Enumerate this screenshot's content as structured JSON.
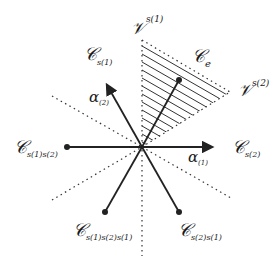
{
  "diagram": {
    "title": "",
    "center": {
      "x": 142,
      "y": 147
    },
    "colors": {
      "stroke": "#222222",
      "hatch": "#333333",
      "background": "#ffffff"
    },
    "labels": {
      "v_s1": {
        "main": "𝒱",
        "sup": "s(1)"
      },
      "v_s2": {
        "main": "𝒱",
        "sup": "s(2)"
      },
      "c_e": {
        "main": "𝒞",
        "sub": "e"
      },
      "c_s1": {
        "main": "𝒞",
        "sub": "s(1)"
      },
      "c_s1s2": {
        "main": "𝒞",
        "sub": "s(1)s(2)"
      },
      "c_s2": {
        "main": "𝒞",
        "sub": "s(2)"
      },
      "c_s1s2s1": {
        "main": "𝒞",
        "sub": "s(1)s(2)s(1)"
      },
      "c_s2s1": {
        "main": "𝒞",
        "sub": "s(2)s(1)"
      },
      "alpha1": {
        "main": "α",
        "sub": "(1)"
      },
      "alpha2": {
        "main": "α",
        "sub": "(2)"
      }
    },
    "rays": [
      {
        "name": "alpha1-arrow",
        "to": [
          214,
          147
        ],
        "arrow": true
      },
      {
        "name": "alpha2-arrow",
        "to": [
          105,
          82
        ],
        "arrow": true
      },
      {
        "name": "ray-upper-right",
        "to": [
          179,
          80
        ],
        "dot": true
      },
      {
        "name": "ray-left",
        "to": [
          67,
          147
        ],
        "dot": true
      },
      {
        "name": "ray-lower-left",
        "to": [
          105,
          212
        ],
        "dot": true
      },
      {
        "name": "ray-lower-right",
        "to": [
          179,
          212
        ],
        "dot": true
      }
    ],
    "hatched_region": "C_e chamber between V^{s(1)} and V^{s(2)}"
  }
}
